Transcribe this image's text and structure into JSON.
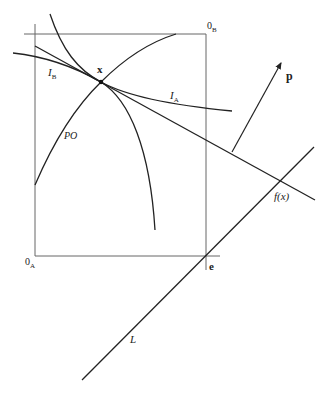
{
  "diagram": {
    "labels": {
      "origin_a": "0",
      "origin_a_sub": "A",
      "origin_b": "0",
      "origin_b_sub": "B",
      "point_x": "x",
      "indiff_b": "I",
      "indiff_b_sub": "B",
      "indiff_a": "I",
      "indiff_a_sub": "A",
      "pareto": "PO",
      "price_vector": "p",
      "f_of_x": "f(x)",
      "endowment": "e",
      "line_l": "L"
    },
    "colors": {
      "stroke": "#222222",
      "box_stroke": "#555555",
      "background": "#ffffff"
    }
  }
}
